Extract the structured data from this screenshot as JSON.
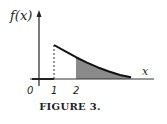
{
  "chart_data": {
    "type": "area",
    "title": "",
    "ylabel": "f(x)",
    "xlabel": "x",
    "x_tick_labels": [
      "0",
      "1",
      "2"
    ],
    "x_ticks": [
      0,
      1,
      2
    ],
    "xlim": [
      0,
      5
    ],
    "function_description": "f(x) = 0 for x < 1; decreasing exponential-like curve for x >= 1",
    "series": [
      {
        "name": "f(x)",
        "x": [
          0,
          1,
          1.5,
          2,
          2.5,
          3,
          3.5,
          4,
          4.5
        ],
        "y": [
          0,
          1.0,
          0.82,
          0.64,
          0.48,
          0.34,
          0.22,
          0.12,
          0.05
        ]
      }
    ],
    "shaded_region": {
      "from": 2,
      "to": 4.5,
      "description": "area under f(x) for x >= 2"
    },
    "dashed_line_at": 1,
    "grid": false,
    "legend": "none",
    "caption": "FIGURE 3."
  }
}
